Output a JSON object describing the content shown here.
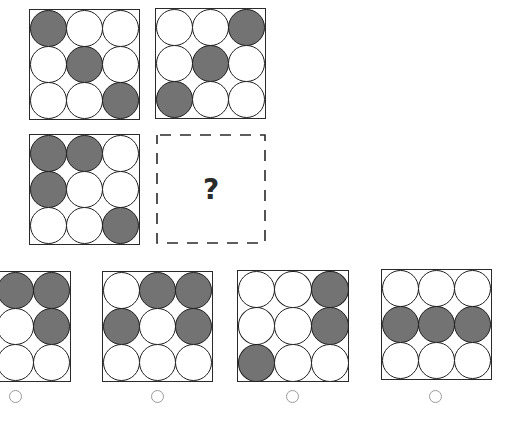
{
  "puzzle": {
    "question_mark": "?",
    "colors": {
      "filled": "#737373",
      "empty": "#ffffff",
      "outline": "#1e1e1e",
      "radio": "#9a9a9a"
    },
    "given_grids": [
      {
        "name": "grid-top-left",
        "x": 29,
        "y": 9,
        "size": 111,
        "cells": [
          1,
          0,
          0,
          0,
          1,
          0,
          0,
          0,
          1
        ]
      },
      {
        "name": "grid-top-right",
        "x": 155,
        "y": 8,
        "size": 111,
        "cells": [
          0,
          0,
          1,
          0,
          1,
          0,
          1,
          0,
          0
        ]
      },
      {
        "name": "grid-middle-left",
        "x": 29,
        "y": 134,
        "size": 111,
        "cells": [
          1,
          1,
          0,
          1,
          0,
          0,
          0,
          0,
          1
        ]
      }
    ],
    "missing_box": {
      "x": 156,
      "y": 134,
      "size": 110
    },
    "options": [
      {
        "label": "A",
        "x": -40,
        "y": 271,
        "size": 111,
        "cells": [
          0,
          1,
          1,
          0,
          0,
          1,
          0,
          0,
          0
        ],
        "radio": {
          "x": 9,
          "y": 390
        }
      },
      {
        "label": "B",
        "x": 102,
        "y": 271,
        "size": 111,
        "cells": [
          0,
          1,
          1,
          1,
          0,
          1,
          0,
          0,
          0
        ],
        "radio": {
          "x": 151,
          "y": 390
        }
      },
      {
        "label": "C",
        "x": 237,
        "y": 270,
        "size": 112,
        "cells": [
          0,
          0,
          1,
          0,
          0,
          1,
          1,
          0,
          0
        ],
        "radio": {
          "x": 286,
          "y": 390
        }
      },
      {
        "label": "D",
        "x": 381,
        "y": 269,
        "size": 111,
        "cells": [
          0,
          0,
          0,
          1,
          1,
          1,
          0,
          0,
          0
        ],
        "radio": {
          "x": 429,
          "y": 390
        }
      }
    ]
  }
}
